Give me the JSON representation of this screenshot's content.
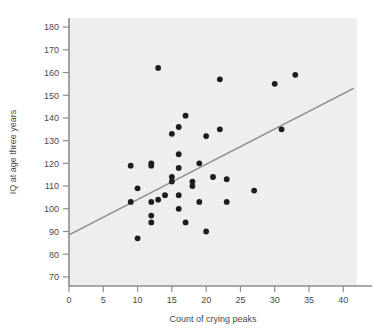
{
  "chart_data": {
    "type": "scatter",
    "title": "",
    "xlabel": "Count of crying peaks",
    "ylabel": "IQ at age three years",
    "xlim": [
      0,
      42
    ],
    "ylim": [
      66,
      184
    ],
    "xticks": [
      0,
      5,
      10,
      15,
      20,
      25,
      30,
      35,
      40
    ],
    "xtick_labels": [
      "0",
      "5",
      "10",
      "15",
      "20",
      "25",
      "30",
      "35",
      "40"
    ],
    "yticks": [
      70,
      80,
      90,
      100,
      110,
      120,
      130,
      140,
      150,
      160,
      170,
      180
    ],
    "ytick_labels": [
      "70",
      "80",
      "90",
      "100",
      "110",
      "120",
      "130",
      "140",
      "150",
      "160",
      "170",
      "180"
    ],
    "grid": false,
    "legend": null,
    "marker_color": "#1c1c1c",
    "plot_background": "#eeeeee",
    "axis_color": "#8d8d8d",
    "trendline": {
      "color": "#8c8c8c",
      "x_start": 0,
      "y_start": 88.5,
      "x_end": 41.5,
      "y_end": 153.0
    },
    "points": [
      {
        "x": 9,
        "y": 119
      },
      {
        "x": 9,
        "y": 103
      },
      {
        "x": 10,
        "y": 109
      },
      {
        "x": 10,
        "y": 87
      },
      {
        "x": 12,
        "y": 120
      },
      {
        "x": 12,
        "y": 119
      },
      {
        "x": 12,
        "y": 103
      },
      {
        "x": 12,
        "y": 97
      },
      {
        "x": 12,
        "y": 94
      },
      {
        "x": 13,
        "y": 162
      },
      {
        "x": 13,
        "y": 104
      },
      {
        "x": 14,
        "y": 106
      },
      {
        "x": 15,
        "y": 133
      },
      {
        "x": 15,
        "y": 114
      },
      {
        "x": 15,
        "y": 112
      },
      {
        "x": 16,
        "y": 136
      },
      {
        "x": 16,
        "y": 124
      },
      {
        "x": 16,
        "y": 118
      },
      {
        "x": 16,
        "y": 106
      },
      {
        "x": 16,
        "y": 100
      },
      {
        "x": 17,
        "y": 141
      },
      {
        "x": 17,
        "y": 94
      },
      {
        "x": 18,
        "y": 112
      },
      {
        "x": 18,
        "y": 110
      },
      {
        "x": 19,
        "y": 120
      },
      {
        "x": 19,
        "y": 103
      },
      {
        "x": 20,
        "y": 132
      },
      {
        "x": 20,
        "y": 90
      },
      {
        "x": 21,
        "y": 114
      },
      {
        "x": 22,
        "y": 157
      },
      {
        "x": 22,
        "y": 135
      },
      {
        "x": 23,
        "y": 113
      },
      {
        "x": 23,
        "y": 103
      },
      {
        "x": 27,
        "y": 108
      },
      {
        "x": 30,
        "y": 155
      },
      {
        "x": 31,
        "y": 135
      },
      {
        "x": 33,
        "y": 159
      }
    ]
  }
}
